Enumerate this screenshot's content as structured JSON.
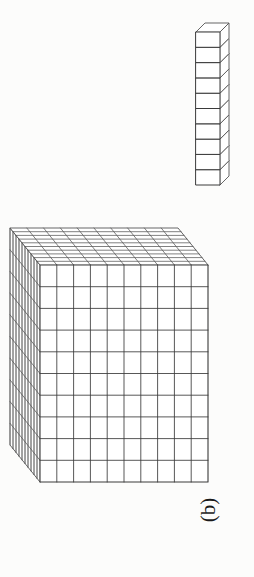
{
  "figure": {
    "panel_label": "(b)",
    "panel_label_rotation_deg": -90,
    "caption_visible_text": "(b)",
    "background_color": "#fcfcfb",
    "ink_color": "#555555",
    "ink_color_dark": "#3a3a3a",
    "page_width": 254,
    "page_height": 577
  },
  "objects": {
    "rod": {
      "name": "unit-rod",
      "cube_count": 10,
      "rows": 10,
      "columns": 1,
      "orientation": "vertical",
      "projection": "oblique",
      "bounds": {
        "x": 196,
        "y": 32,
        "width": 36,
        "height": 153
      },
      "cell_height": 15.3,
      "cell_width": 24,
      "depth_dx": 9,
      "depth_dy": -9
    },
    "block": {
      "name": "thousand-cube",
      "dimensions_label": "10 x 10 x 10",
      "rows": 10,
      "columns": 10,
      "layers": 10,
      "unit_count": 1000,
      "projection": "oblique",
      "front_face": {
        "x": 40,
        "y": 265,
        "width": 168,
        "height": 217
      },
      "depth_dx": -30,
      "depth_dy": -37
    }
  },
  "chart_data": {
    "type": "diagram",
    "title": "(b)",
    "items": [
      {
        "label": "rod",
        "units": 10,
        "shape": "1 x 1 x 10"
      },
      {
        "label": "cube",
        "units": 1000,
        "shape": "10 x 10 x 10"
      }
    ],
    "grid": true,
    "legend": false
  }
}
